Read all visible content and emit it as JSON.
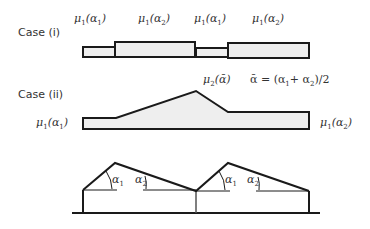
{
  "case1": {
    "title": "Case (i)",
    "labels": [
      {
        "mu": "μ",
        "mu_sub": "1",
        "arg": "α",
        "arg_sub": "1"
      },
      {
        "mu": "μ",
        "mu_sub": "1",
        "arg": "α",
        "arg_sub": "2"
      },
      {
        "mu": "μ",
        "mu_sub": "1",
        "arg": "α",
        "arg_sub": "1"
      },
      {
        "mu": "μ",
        "mu_sub": "1",
        "arg": "α",
        "arg_sub": "2"
      }
    ]
  },
  "case2": {
    "title": "Case (ii)",
    "left_label": {
      "mu": "μ",
      "mu_sub": "1",
      "arg": "α",
      "arg_sub": "1"
    },
    "right_label": {
      "mu": "μ",
      "mu_sub": "1",
      "arg": "α",
      "arg_sub": "2"
    },
    "peak_label": {
      "mu": "μ",
      "mu_sub": "2",
      "arg": "ᾱ"
    },
    "formula": {
      "lhs": "ᾱ = (α",
      "s1": "1",
      "mid": "+ α",
      "s2": "2",
      "rhs": ")/2"
    }
  },
  "roof": {
    "angles": [
      {
        "sym": "α",
        "sub": "1"
      },
      {
        "sym": "α",
        "sub": "2"
      },
      {
        "sym": "α",
        "sub": "1"
      },
      {
        "sym": "α",
        "sub": "2"
      }
    ]
  },
  "colors": {
    "fill": "#eeeeee",
    "stroke": "#1a1a1a"
  }
}
